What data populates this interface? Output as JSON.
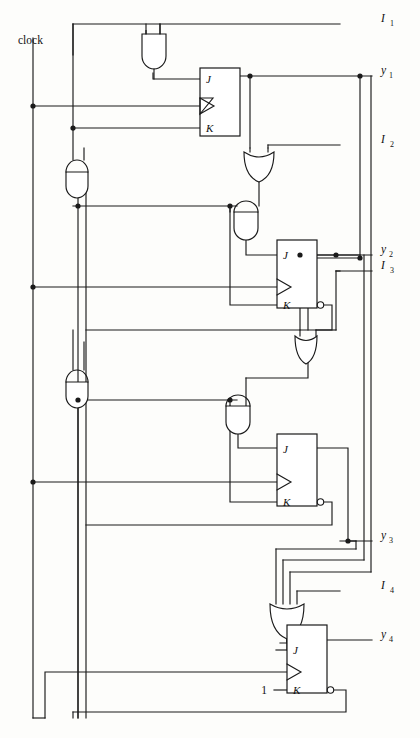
{
  "diagram": {
    "type": "logic-circuit-schematic",
    "background_color": "#fdfdfb",
    "line_color": "#1a1a1a"
  },
  "labels": {
    "clock": "clock",
    "constant_one": "1",
    "inputs": [
      {
        "name": "I1",
        "base": "I",
        "sub": "1",
        "y": 24
      },
      {
        "name": "I2",
        "base": "I",
        "sub": "2",
        "y": 145
      },
      {
        "name": "I3",
        "base": "I",
        "sub": "3",
        "y": 271
      },
      {
        "name": "I4",
        "base": "I",
        "sub": "4",
        "y": 591
      }
    ],
    "outputs": [
      {
        "name": "y1",
        "base": "y",
        "sub": "1",
        "y": 76
      },
      {
        "name": "y2",
        "base": "y",
        "sub": "2",
        "y": 255
      },
      {
        "name": "y3",
        "base": "y",
        "sub": "3",
        "y": 541
      },
      {
        "name": "y4",
        "base": "y",
        "sub": "4",
        "y": 640
      }
    ]
  },
  "flipflops": [
    {
      "id": "ff1",
      "j_label": "J",
      "k_label": "K",
      "output": "y1",
      "clock_input": "triangle",
      "inverted_output": false
    },
    {
      "id": "ff2",
      "j_label": "J",
      "k_label": "K",
      "output": "y2",
      "clock_input": "triangle",
      "inverted_output": true
    },
    {
      "id": "ff3",
      "j_label": "J",
      "k_label": "K",
      "output": "y3",
      "clock_input": "triangle",
      "inverted_output": true
    },
    {
      "id": "ff4",
      "j_label": "J",
      "k_label": "K",
      "output": "y4",
      "clock_input": "triangle",
      "inverted_output": true
    }
  ],
  "gates": [
    {
      "id": "and1",
      "type": "AND",
      "inputs": 2,
      "orientation": "down"
    },
    {
      "id": "and2",
      "type": "AND",
      "inputs": 2,
      "orientation": "down"
    },
    {
      "id": "and3",
      "type": "AND",
      "inputs": 2,
      "orientation": "down"
    },
    {
      "id": "and4",
      "type": "AND",
      "inputs": 2,
      "orientation": "down"
    },
    {
      "id": "and5",
      "type": "AND",
      "inputs": 2,
      "orientation": "down"
    },
    {
      "id": "or1",
      "type": "OR",
      "inputs": 2,
      "orientation": "down"
    },
    {
      "id": "or2",
      "type": "OR",
      "inputs": 2,
      "orientation": "down"
    },
    {
      "id": "or3",
      "type": "OR",
      "inputs": 4,
      "orientation": "down"
    }
  ]
}
